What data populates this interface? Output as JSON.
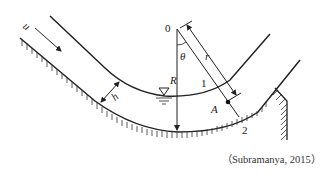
{
  "diagram": {
    "type": "curved open channel flow (concave bed curvature)",
    "labels": {
      "velocity": "u",
      "depth": "h",
      "center": "0",
      "angle": "θ",
      "radius_of_curvature": "R",
      "radial_distance": "r",
      "point1": "1",
      "point2": "2",
      "pointA": "A"
    },
    "symbols": {
      "water_surface": "free-surface-triangle"
    },
    "caption": "（Subramanya, 2015）"
  }
}
